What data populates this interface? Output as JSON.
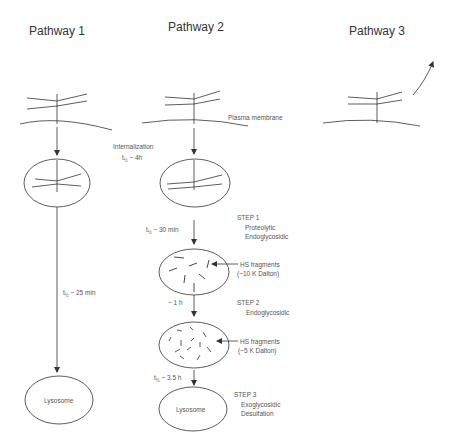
{
  "pathways": [
    {
      "title": "Pathway 1",
      "half_life": "~ 25 min",
      "destination": "Lysosome"
    },
    {
      "title": "Pathway 2",
      "membrane_label": "Plasma membrane",
      "internalization": {
        "label": "Internalization",
        "half_life": "~ 4h"
      },
      "steps": [
        {
          "half_life": "~ 30 min",
          "step": "STEP 1",
          "lines": [
            "Proteolytic",
            "Endoglycosidic"
          ],
          "fragments_label": "HS fragments",
          "fragments_size": "(~10 K Dalton)"
        },
        {
          "half_life": "~ 1 h",
          "step": "STEP 2",
          "lines": [
            "Endoglycosidic"
          ],
          "fragments_label": "HS fragments",
          "fragments_size": "(~5 K Dalton)"
        },
        {
          "half_life": "~ 3.5 h",
          "step": "STEP 3",
          "lines": [
            "Exoglycosidic",
            "Desulfation"
          ]
        }
      ],
      "destination": "Lysosome"
    },
    {
      "title": "Pathway 3"
    }
  ],
  "t_symbol": "t",
  "t_sub": "½",
  "colors": {
    "line": "#333333",
    "text": "#444444"
  }
}
